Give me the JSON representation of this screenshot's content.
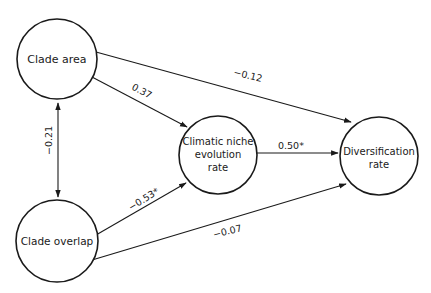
{
  "diagram": {
    "type": "path-diagram",
    "nodes": [
      {
        "id": "clade_area",
        "label_lines": [
          "Clade area"
        ]
      },
      {
        "id": "clade_overlap",
        "label_lines": [
          "Clade overlap"
        ]
      },
      {
        "id": "climatic_niche",
        "label_lines": [
          "Climatic niche",
          "evolution",
          "rate"
        ]
      },
      {
        "id": "diversification",
        "label_lines": [
          "Diversification",
          "rate"
        ]
      }
    ],
    "edges": [
      {
        "from": "clade_area",
        "to": "climatic_niche",
        "label": "0.37",
        "direction": "one-way"
      },
      {
        "from": "clade_area",
        "to": "diversification",
        "label": "−0.12",
        "direction": "one-way"
      },
      {
        "from": "clade_area",
        "to": "clade_overlap",
        "label": "−0.21",
        "direction": "two-way"
      },
      {
        "from": "clade_overlap",
        "to": "climatic_niche",
        "label": "−0.53*",
        "direction": "one-way"
      },
      {
        "from": "clade_overlap",
        "to": "diversification",
        "label": "−0.07",
        "direction": "one-way"
      },
      {
        "from": "climatic_niche",
        "to": "diversification",
        "label": "0.50*",
        "direction": "one-way"
      }
    ]
  }
}
